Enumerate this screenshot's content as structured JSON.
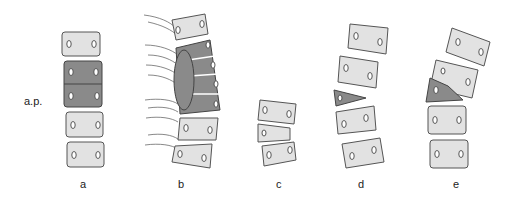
{
  "figure": {
    "side_label": "a.p.",
    "panels": [
      {
        "id": "a",
        "label": "a",
        "description": "Straight column with two fused (block) vertebrae shaded dark"
      },
      {
        "id": "b",
        "label": "b",
        "description": "Curved column with unilateral unsegmented bar across several vertebrae, with nerve roots"
      },
      {
        "id": "c",
        "label": "c",
        "description": "Three vertebrae, middle one wedge-shaped"
      },
      {
        "id": "d",
        "label": "d",
        "description": "Column with a dark triangular hemivertebra inserted"
      },
      {
        "id": "e",
        "label": "e",
        "description": "Column with dark hemivertebra fused to adjacent vertebra causing tilt"
      }
    ]
  },
  "colors": {
    "light_body": "#e2e2e2",
    "dark_body": "#8a8a8a",
    "outline": "#555555"
  }
}
